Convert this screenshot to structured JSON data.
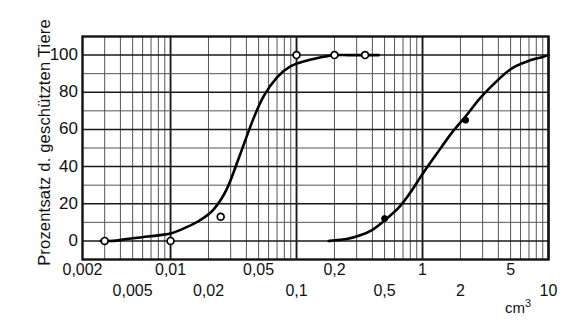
{
  "axes": {
    "y_title": "Prozentsatz d. geschützten Tiere",
    "x_unit_base": "cm",
    "x_unit_exp": "3",
    "y_ticks": [
      "0",
      "20",
      "40",
      "60",
      "80",
      "100"
    ],
    "x_ticks_upper": [
      "0,002",
      "0,01",
      "0,05",
      "0,2",
      "1",
      "5"
    ],
    "x_ticks_lower": [
      "0,005",
      "0,02",
      "0,1",
      "0,5",
      "2",
      "10"
    ]
  },
  "colors": {
    "ink": "#111111",
    "grid_major": "#1a1a1a",
    "grid_minor": "#555555",
    "curve": "#000000",
    "marker_open_fill": "#ffffff"
  },
  "chart_data": {
    "type": "line",
    "title": "",
    "xlabel": "cm3",
    "ylabel": "Prozentsatz d. geschützten Tiere",
    "xscale": "log",
    "xlim": [
      0.002,
      10
    ],
    "ylim": [
      -10,
      110
    ],
    "grid": true,
    "legend": "none",
    "y_tick_values": [
      0,
      20,
      40,
      60,
      80,
      100
    ],
    "x_tick_values": [
      0.002,
      0.005,
      0.01,
      0.02,
      0.05,
      0.1,
      0.2,
      0.5,
      1,
      2,
      5,
      10
    ],
    "x_tick_labels": [
      "0,002",
      "0,005",
      "0,01",
      "0,02",
      "0,05",
      "0,1",
      "0,2",
      "0,5",
      "1",
      "2",
      "5",
      "10"
    ],
    "series": [
      {
        "name": "Kurve 1",
        "marker": "open-circle",
        "line_x": [
          0.0028,
          0.0035,
          0.0045,
          0.006,
          0.008,
          0.01,
          0.013,
          0.017,
          0.022,
          0.028,
          0.035,
          0.045,
          0.055,
          0.07,
          0.09,
          0.12,
          0.16,
          0.2,
          0.26,
          0.35,
          0.45
        ],
        "line_y": [
          0,
          0,
          1,
          2,
          3,
          4,
          7,
          11,
          17,
          28,
          45,
          65,
          78,
          88,
          94,
          97,
          99,
          100,
          100,
          100,
          100
        ],
        "points_x": [
          0.003,
          0.01,
          0.025,
          0.1,
          0.2,
          0.35
        ],
        "points_y": [
          0,
          0,
          13,
          100,
          100,
          100
        ]
      },
      {
        "name": "Kurve 2",
        "marker": "filled-circle",
        "line_x": [
          0.18,
          0.25,
          0.32,
          0.4,
          0.5,
          0.65,
          0.8,
          1.0,
          1.3,
          1.7,
          2.2,
          2.8,
          3.5,
          4.5,
          5.5,
          7.0,
          9.0,
          10.0
        ],
        "line_y": [
          0,
          1,
          3,
          6,
          11,
          18,
          26,
          36,
          47,
          58,
          67,
          76,
          83,
          90,
          94,
          97,
          99,
          100
        ],
        "points_x": [
          0.5,
          2.2
        ],
        "points_y": [
          12,
          65
        ]
      }
    ]
  }
}
